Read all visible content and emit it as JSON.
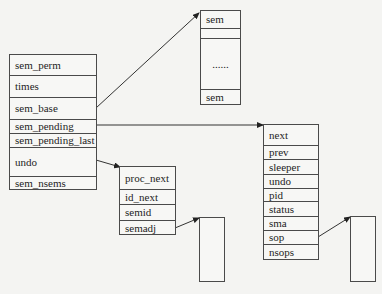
{
  "sem_array": {
    "fields": [
      "sem_perm",
      "times",
      "sem_base",
      "sem_pending",
      "sem_pending_last",
      "undo",
      "sem_nsems"
    ]
  },
  "sem_list": {
    "rows": [
      "sem",
      "",
      "......",
      "sem"
    ]
  },
  "sem_undo": {
    "fields": [
      "proc_next",
      "id_next",
      "semid",
      "semadj"
    ]
  },
  "sem_queue": {
    "fields": [
      "next",
      "prev",
      "sleeper",
      "undo",
      "pid",
      "status",
      "sma",
      "sop",
      "nsops"
    ]
  },
  "arrows": [
    {
      "from": "sem_array.sem_base",
      "to": "sem_list"
    },
    {
      "from": "sem_array.sem_pending",
      "to": "sem_queue"
    },
    {
      "from": "sem_array.undo",
      "to": "sem_undo"
    },
    {
      "from": "sem_undo.semadj",
      "to": "semadj_array"
    },
    {
      "from": "sem_queue.sop",
      "to": "sop_array"
    }
  ]
}
